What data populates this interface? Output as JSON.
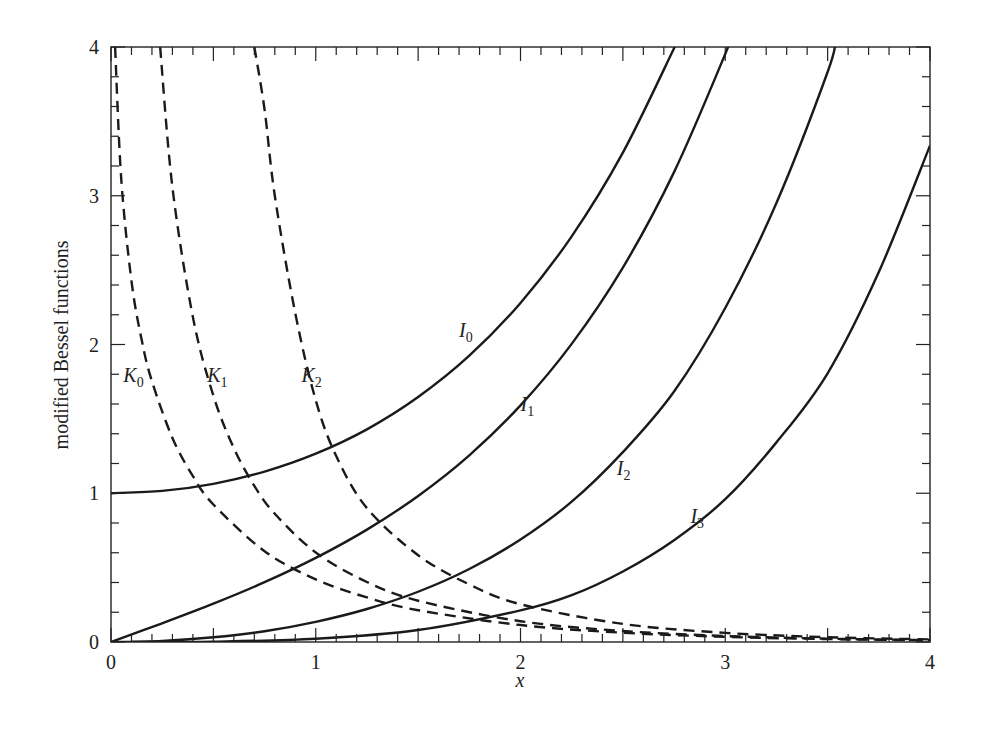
{
  "chart_data": {
    "type": "line",
    "title": "",
    "xlabel": "x",
    "ylabel": "modified Bessel functions",
    "xlim": [
      0,
      4
    ],
    "ylim": [
      0,
      4
    ],
    "grid": false,
    "x_ticks": [
      "0",
      "1",
      "2",
      "3",
      "4"
    ],
    "y_ticks": [
      "0",
      "1",
      "2",
      "3",
      "4"
    ],
    "series": [
      {
        "name": "I0",
        "label": "I",
        "sub": "0",
        "style": "solid",
        "points": [
          [
            0,
            1
          ],
          [
            0.25,
            1.0157
          ],
          [
            0.5,
            1.0635
          ],
          [
            0.75,
            1.1456
          ],
          [
            1,
            1.2661
          ],
          [
            1.25,
            1.4296
          ],
          [
            1.5,
            1.6467
          ],
          [
            1.75,
            1.9245
          ],
          [
            2,
            2.2796
          ],
          [
            2.25,
            2.727
          ],
          [
            2.5,
            3.2898
          ],
          [
            2.75,
            3.9917
          ],
          [
            2.77,
            4.05
          ]
        ],
        "label_pos": [
          1.7,
          2.05
        ]
      },
      {
        "name": "I1",
        "label": "I",
        "sub": "1",
        "style": "solid",
        "points": [
          [
            0,
            0
          ],
          [
            0.25,
            0.126
          ],
          [
            0.5,
            0.2579
          ],
          [
            0.75,
            0.402
          ],
          [
            1,
            0.5652
          ],
          [
            1.25,
            0.7553
          ],
          [
            1.5,
            0.9817
          ],
          [
            1.75,
            1.255
          ],
          [
            2,
            1.5906
          ],
          [
            2.25,
            2.004
          ],
          [
            2.5,
            2.5167
          ],
          [
            2.75,
            3.1587
          ],
          [
            3,
            3.9534
          ],
          [
            3.02,
            4.05
          ]
        ],
        "label_pos": [
          2.0,
          1.55
        ]
      },
      {
        "name": "I2",
        "label": "I",
        "sub": "2",
        "style": "solid",
        "points": [
          [
            0,
            0
          ],
          [
            0.25,
            0.0079
          ],
          [
            0.5,
            0.0319
          ],
          [
            0.75,
            0.0725
          ],
          [
            1,
            0.1357
          ],
          [
            1.25,
            0.222
          ],
          [
            1.5,
            0.3378
          ],
          [
            1.75,
            0.4907
          ],
          [
            2,
            0.6889
          ],
          [
            2.25,
            0.9434
          ],
          [
            2.5,
            1.2765
          ],
          [
            2.75,
            1.6838
          ],
          [
            3,
            2.2452
          ],
          [
            3.25,
            2.9514
          ],
          [
            3.5,
            3.832
          ],
          [
            3.54,
            4.05
          ]
        ],
        "label_pos": [
          2.47,
          1.12
        ]
      },
      {
        "name": "I3",
        "label": "I",
        "sub": "3",
        "style": "solid",
        "points": [
          [
            0.1,
            0
          ],
          [
            0.5,
            0.0026
          ],
          [
            1,
            0.0222
          ],
          [
            1.5,
            0.0807
          ],
          [
            2,
            0.2127
          ],
          [
            2.25,
            0.3149
          ],
          [
            2.5,
            0.4743
          ],
          [
            2.75,
            0.6846
          ],
          [
            3,
            0.9598
          ],
          [
            3.25,
            1.342
          ],
          [
            3.5,
            1.8065
          ],
          [
            3.75,
            2.487
          ],
          [
            4,
            3.3372
          ]
        ],
        "label_pos": [
          2.83,
          0.8
        ]
      },
      {
        "name": "K0",
        "label": "K",
        "sub": "0",
        "style": "dashed",
        "points": [
          [
            0.02,
            4.0
          ],
          [
            0.05,
            3.114
          ],
          [
            0.1,
            2.427
          ],
          [
            0.15,
            2.03
          ],
          [
            0.2,
            1.753
          ],
          [
            0.3,
            1.372
          ],
          [
            0.4,
            1.115
          ],
          [
            0.5,
            0.9244
          ],
          [
            0.75,
            0.6106
          ],
          [
            1,
            0.421
          ],
          [
            1.25,
            0.2998
          ],
          [
            1.5,
            0.2138
          ],
          [
            2,
            0.1139
          ],
          [
            2.5,
            0.0623
          ],
          [
            3,
            0.0347
          ],
          [
            3.5,
            0.0196
          ],
          [
            4,
            0.0112
          ]
        ],
        "label_pos": [
          0.06,
          1.75
        ]
      },
      {
        "name": "K1",
        "label": "K",
        "sub": "1",
        "style": "dashed",
        "points": [
          [
            0.24,
            4.0
          ],
          [
            0.3,
            3.056
          ],
          [
            0.4,
            2.184
          ],
          [
            0.5,
            1.656
          ],
          [
            0.6,
            1.303
          ],
          [
            0.7,
            1.0503
          ],
          [
            0.8,
            0.8618
          ],
          [
            1,
            0.6019
          ],
          [
            1.25,
            0.4035
          ],
          [
            1.5,
            0.2774
          ],
          [
            2,
            0.1399
          ],
          [
            2.5,
            0.0739
          ],
          [
            3,
            0.0402
          ],
          [
            3.5,
            0.0222
          ],
          [
            4,
            0.0125
          ]
        ],
        "label_pos": [
          0.47,
          1.75
        ]
      },
      {
        "name": "K2",
        "label": "K",
        "sub": "2",
        "style": "dashed",
        "points": [
          [
            0.7,
            4.0
          ],
          [
            0.75,
            3.58
          ],
          [
            0.8,
            3.0
          ],
          [
            0.9,
            2.21
          ],
          [
            1,
            1.6248
          ],
          [
            1.1,
            1.25
          ],
          [
            1.25,
            0.9
          ],
          [
            1.5,
            0.5836
          ],
          [
            1.75,
            0.387
          ],
          [
            2,
            0.2538
          ],
          [
            2.5,
            0.1215
          ],
          [
            3,
            0.0615
          ],
          [
            3.5,
            0.0323
          ],
          [
            4,
            0.0174
          ]
        ],
        "label_pos": [
          0.93,
          1.75
        ]
      }
    ]
  }
}
